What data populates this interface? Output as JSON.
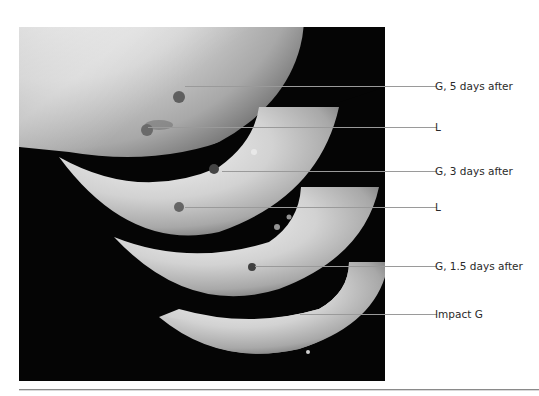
{
  "figure": {
    "labels": [
      {
        "id": "g5",
        "text": "G, 5 days after"
      },
      {
        "id": "l1",
        "text": "L"
      },
      {
        "id": "g3",
        "text": "G, 3 days after"
      },
      {
        "id": "l2",
        "text": "L"
      },
      {
        "id": "g15",
        "text": "G, 1.5 days after"
      },
      {
        "id": "impact",
        "text": "Impact G"
      }
    ]
  }
}
